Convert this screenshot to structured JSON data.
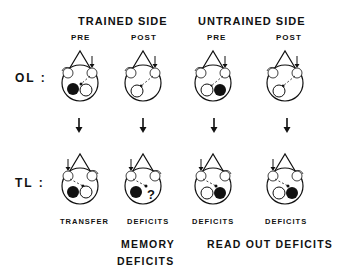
{
  "headers": {
    "trained_side": "TRAINED SIDE",
    "untrained_side": "UNTRAINED SIDE"
  },
  "columns": [
    {
      "label": "PRE"
    },
    {
      "label": "POST"
    },
    {
      "label": "PRE"
    },
    {
      "label": "POST"
    }
  ],
  "rows": {
    "ol": "OL :",
    "tl": "TL :"
  },
  "results": [
    {
      "label": "TRANSFER"
    },
    {
      "label": "DEFICITS"
    },
    {
      "label": "DEFICITS"
    },
    {
      "label": "DEFICITS"
    }
  ],
  "summary": {
    "memory_line1": "MEMORY",
    "memory_line2": "DEFICITS",
    "readout": "READ OUT DEFICITS"
  },
  "ol_row": [
    {
      "left_eye": "filled",
      "right_eye": "open",
      "link_to": "right",
      "stim_side": "right"
    },
    {
      "left_eye": "open",
      "right_eye": "none",
      "link_to": "left",
      "stim_side": "right"
    },
    {
      "left_eye": "open",
      "right_eye": "filled",
      "link_to": "left",
      "stim_side": "right"
    },
    {
      "left_eye": "open",
      "right_eye": "none",
      "link_to": "left",
      "stim_side": "right"
    }
  ],
  "tl_row": [
    {
      "left_eye": "filled",
      "right_eye": "open",
      "link_to": "right",
      "stim_side": "left"
    },
    {
      "left_eye": "filled",
      "right_eye": "question",
      "link_to": "right",
      "stim_side": "left"
    },
    {
      "left_eye": "open",
      "right_eye": "filled",
      "link_to": "right",
      "stim_side": "left"
    },
    {
      "left_eye": "open",
      "right_eye": "filled",
      "link_to": "right",
      "stim_side": "left"
    }
  ],
  "question_mark": "?"
}
